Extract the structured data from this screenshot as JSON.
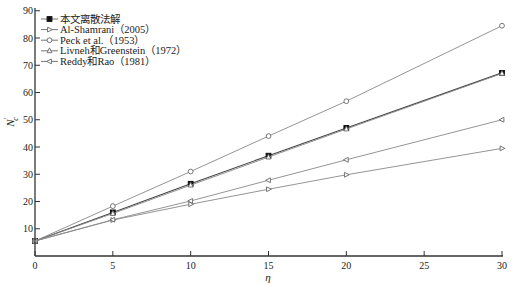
{
  "chart_data": {
    "type": "line",
    "title": "",
    "xlabel": "η",
    "ylabel": "N_c'",
    "xlim": [
      0,
      30
    ],
    "ylim": [
      0,
      90
    ],
    "x_ticks": [
      0,
      5,
      10,
      15,
      20,
      25,
      30
    ],
    "y_ticks": [
      10,
      20,
      30,
      40,
      50,
      60,
      70,
      80,
      90
    ],
    "grid": false,
    "legend_position": "upper left",
    "x": [
      0,
      5,
      10,
      15,
      20,
      30
    ],
    "series": [
      {
        "name": "本文离散法解",
        "marker": "square-filled",
        "values": [
          5.5,
          16,
          26.5,
          36.8,
          47,
          67.2
        ]
      },
      {
        "name": "Al-Shamrani (2005)",
        "marker": "triangle-right",
        "values": [
          5.5,
          13.2,
          19,
          24.5,
          29.8,
          39.5
        ]
      },
      {
        "name": "Peck et al. (1953)",
        "marker": "circle",
        "values": [
          5.5,
          18.3,
          31,
          44,
          56.8,
          84.5
        ]
      },
      {
        "name": "Livneh和Greenstein (1972)",
        "marker": "triangle-up",
        "values": [
          5.5,
          15.6,
          26,
          36.3,
          46.6,
          67
        ]
      },
      {
        "name": "Reddy和Rao (1981)",
        "marker": "triangle-left",
        "values": [
          5.5,
          13.3,
          20.2,
          27.8,
          35.3,
          50
        ]
      }
    ]
  },
  "legend": {
    "items": [
      "本文离散法解",
      "Al-Shamrani（2005）",
      "Peck et al.（1953）",
      "Livneh和Greenstein（1972）",
      "Reddy和Rao（1981）"
    ]
  },
  "axes": {
    "x_label": "η",
    "y_label_main": "N",
    "y_label_sub": "c",
    "y_label_prime": "′",
    "x_tick_labels": [
      "0",
      "5",
      "10",
      "15",
      "20",
      "25",
      "30"
    ],
    "y_tick_labels": [
      "10",
      "20",
      "30",
      "40",
      "50",
      "60",
      "70",
      "80",
      "90"
    ]
  },
  "colors": {
    "axis": "#333333",
    "line": "#7a7a7a",
    "main_line": "#555555",
    "marker_fill": "#111111"
  }
}
